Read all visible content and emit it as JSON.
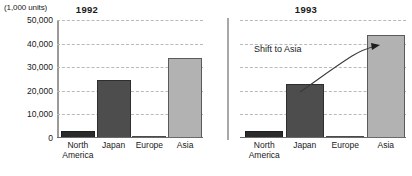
{
  "figure": {
    "unit_caption": "(1,000 units)"
  },
  "chart_data": {
    "type": "bar",
    "title": "",
    "xlabel": "",
    "ylabel": "(1,000 units)",
    "ylim": [
      0,
      50000
    ],
    "yticks": [
      0,
      10000,
      20000,
      30000,
      40000,
      50000
    ],
    "ytick_labels": [
      "0",
      "10,000",
      "20,000",
      "30,000",
      "40,000",
      "50,000"
    ],
    "grid": true,
    "legend_position": "none",
    "categories": [
      "North America",
      "Japan",
      "Europe",
      "Asia"
    ],
    "category_lines": [
      [
        "North",
        "America"
      ],
      [
        "Japan",
        ""
      ],
      [
        "Europe",
        ""
      ],
      [
        "Asia",
        ""
      ]
    ],
    "colors": {
      "north_america": "#2a2a2a",
      "japan": "#4d4d4d",
      "europe": "#ffffff",
      "asia": "#b2b2b2",
      "gridline": "#b9b9b9",
      "axis": "#9a9a9a"
    },
    "panels": [
      {
        "title": "1992",
        "values": [
          3000,
          24500,
          500,
          34000
        ]
      },
      {
        "title": "1993",
        "values": [
          3000,
          23000,
          500,
          43500
        ],
        "annotation": "Shift to Asia"
      }
    ]
  }
}
